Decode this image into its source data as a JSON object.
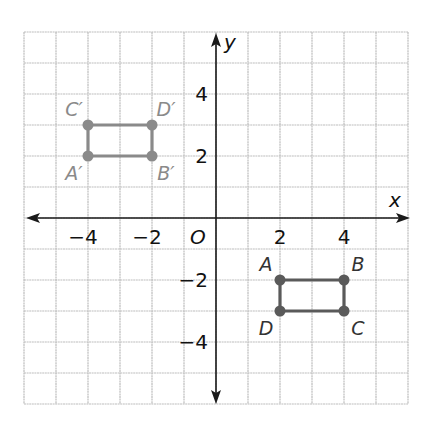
{
  "figure": {
    "title": "",
    "axes": {
      "x_label": "x",
      "y_label": "y",
      "origin_label": "O",
      "x_range": [
        -6,
        6
      ],
      "y_range": [
        -6,
        6
      ],
      "x_ticks": [
        {
          "value": -4,
          "label": "−4"
        },
        {
          "value": -2,
          "label": "−2"
        },
        {
          "value": 2,
          "label": "2"
        },
        {
          "value": 4,
          "label": "4"
        }
      ],
      "y_ticks": [
        {
          "value": 4,
          "label": "4"
        },
        {
          "value": 2,
          "label": "2"
        },
        {
          "value": -2,
          "label": "−2"
        },
        {
          "value": -4,
          "label": "−4"
        }
      ],
      "grid": true
    },
    "shapes": [
      {
        "name": "original-rectangle",
        "color": "#5a5a5a",
        "label_color": "#333333",
        "points": [
          {
            "label": "A",
            "x": 2,
            "y": -2,
            "label_pos": "top-left"
          },
          {
            "label": "B",
            "x": 4,
            "y": -2,
            "label_pos": "top-right"
          },
          {
            "label": "C",
            "x": 4,
            "y": -3,
            "label_pos": "bottom-right"
          },
          {
            "label": "D",
            "x": 2,
            "y": -3,
            "label_pos": "bottom-left"
          }
        ]
      },
      {
        "name": "image-rectangle",
        "color": "#8a8a8a",
        "label_color": "#8a8a8a",
        "points": [
          {
            "label": "A′",
            "x": -4,
            "y": 2,
            "label_pos": "bottom-left"
          },
          {
            "label": "B′",
            "x": -2,
            "y": 2,
            "label_pos": "bottom-right"
          },
          {
            "label": "D′",
            "x": -2,
            "y": 3,
            "label_pos": "top-right"
          },
          {
            "label": "C′",
            "x": -4,
            "y": 3,
            "label_pos": "top-left"
          }
        ]
      }
    ],
    "colors": {
      "grid": "#bdbdbd",
      "axis": "#1a1a1a"
    }
  }
}
